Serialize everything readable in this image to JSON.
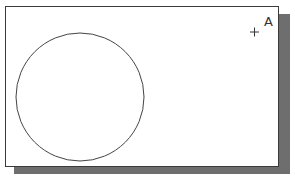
{
  "diagram": {
    "title": "",
    "elements": [
      {
        "type": "circle",
        "name": "drawn-circle"
      },
      {
        "type": "point-marker",
        "name": "point-a",
        "label": "A"
      }
    ]
  },
  "point": {
    "label": "A",
    "marker_glyph": "+"
  },
  "colors": {
    "frame_border": "#3a3a3a",
    "shadow": "#6e6e6e",
    "stroke": "#444444",
    "background": "#ffffff"
  }
}
